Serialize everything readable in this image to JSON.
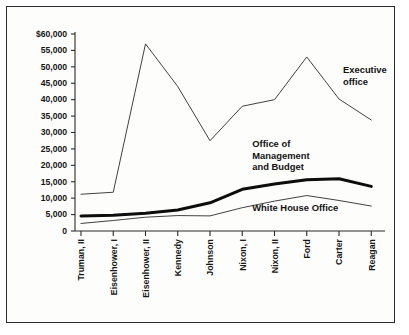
{
  "figure": {
    "border_color": "#2b2b2b",
    "background": "#fdfdfc"
  },
  "chart_data": {
    "type": "line",
    "title": "",
    "subtitle": "",
    "xlabel": "",
    "ylabel": "",
    "grid": false,
    "legend_position": "inline-annotations",
    "categories": [
      "Truman, II",
      "Eisenhower, I",
      "Eisenhower, II",
      "Kennedy",
      "Johnson",
      "Nixon, I",
      "Nixon, II",
      "Ford",
      "Carter",
      "Reagan"
    ],
    "ylim": [
      0,
      60000
    ],
    "ytick_values": [
      0,
      5000,
      10000,
      15000,
      20000,
      25000,
      30000,
      35000,
      40000,
      45000,
      50000,
      55000,
      60000
    ],
    "ytick_labels": [
      "0",
      "5,000",
      "10,000",
      "15,000",
      "20,000",
      "25,000",
      "30,000",
      "35,000",
      "40,000",
      "45,000",
      "50,000",
      "55,000",
      "$60,000"
    ],
    "series": [
      {
        "name": "Executive office",
        "style": "thin",
        "values": [
          11200,
          11800,
          57000,
          44000,
          27500,
          38000,
          40000,
          53000,
          40200,
          33800
        ]
      },
      {
        "name": "Office of Management and Budget",
        "style": "thick",
        "values": [
          4600,
          4800,
          5400,
          6400,
          8600,
          12700,
          14300,
          15600,
          15900,
          13600
        ]
      },
      {
        "name": "White House Office",
        "style": "thin",
        "values": [
          2300,
          3200,
          4200,
          4700,
          4600,
          7100,
          9100,
          10800,
          9300,
          7600
        ]
      }
    ],
    "annotations": [
      {
        "text_lines": [
          "Executive",
          "office"
        ],
        "series": "Executive office"
      },
      {
        "text_lines": [
          "Office of",
          "Management",
          "and Budget"
        ],
        "series": "Office of Management and Budget"
      },
      {
        "text_lines": [
          "White House Office"
        ],
        "series": "White House Office"
      }
    ]
  }
}
